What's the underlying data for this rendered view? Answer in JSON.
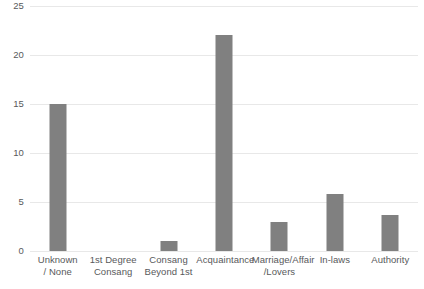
{
  "chart_data": {
    "type": "bar",
    "title": "",
    "subtitle": "",
    "xlabel": "",
    "ylabel": "",
    "categories": [
      "Unknown / None",
      "1st Degree Consang",
      "Consang Beyond 1st",
      "Acquaintance",
      "Marriage/Affair /Lovers",
      "In-laws",
      "Authority"
    ],
    "category_label_lines": [
      [
        "Unknown",
        "/ None"
      ],
      [
        "1st Degree",
        "Consang"
      ],
      [
        "Consang",
        "Beyond 1st"
      ],
      [
        "Acquaintance"
      ],
      [
        "Marriage/Affair",
        "/Lovers"
      ],
      [
        "In-laws"
      ],
      [
        "Authority"
      ]
    ],
    "values": [
      15,
      0,
      1,
      22,
      3,
      5.8,
      3.7
    ],
    "ylim": [
      0,
      25
    ],
    "ytick_values": [
      0,
      5,
      10,
      15,
      20,
      25
    ],
    "ytick_labels": [
      "0",
      "5",
      "10",
      "15",
      "20",
      "25"
    ],
    "grid": "horizontal",
    "legend": "none",
    "bar_color": "#808080",
    "gridline_color": "#e8e8e8",
    "axis_text_color": "#58595b",
    "background_color": "#ffffff"
  }
}
